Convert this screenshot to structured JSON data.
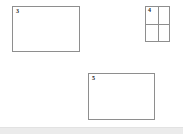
{
  "canvas": {
    "width": 183,
    "height": 134,
    "background_color": "#ffffff",
    "stroke_color": "#8e8e8e",
    "label_color": "#1c1c1c"
  },
  "regions": [
    {
      "label": "3",
      "name": "region-box-3",
      "x": 12,
      "y": 6,
      "width": 68,
      "height": 46,
      "subdivided": false
    },
    {
      "label": "4",
      "name": "region-box-4",
      "x": 145,
      "y": 6,
      "width": 25,
      "height": 36,
      "subdivided": true,
      "grid_rows": 2,
      "grid_cols": 2
    },
    {
      "label": "5",
      "name": "region-box-5",
      "x": 88,
      "y": 73,
      "width": 67,
      "height": 47,
      "subdivided": false
    }
  ],
  "footer": {
    "band_color": "#ebebeb"
  }
}
